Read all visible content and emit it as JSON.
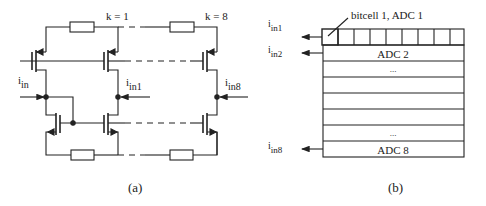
{
  "figure_a": {
    "caption": "(a)",
    "labels": {
      "k1": "k = 1",
      "k8": "k = 8",
      "iin_main": "i",
      "iin_main_sub": "in",
      "iin1_main": "i",
      "iin1_sub": "in1",
      "iin8_main": "i",
      "iin8_sub": "in8"
    }
  },
  "figure_b": {
    "caption": "(b)",
    "callout": "bitcell 1, ADC 1",
    "rows": [
      "",
      "ADC 2",
      "...",
      "",
      "",
      "",
      "...",
      "ADC 8"
    ],
    "bitcells_in_first_row": 9,
    "inputs": [
      {
        "main": "i",
        "sub": "in1"
      },
      {
        "main": "i",
        "sub": "in2"
      },
      {
        "main": "i",
        "sub": "in8"
      }
    ]
  },
  "colors": {
    "line": "#222222",
    "background": "#ffffff"
  }
}
